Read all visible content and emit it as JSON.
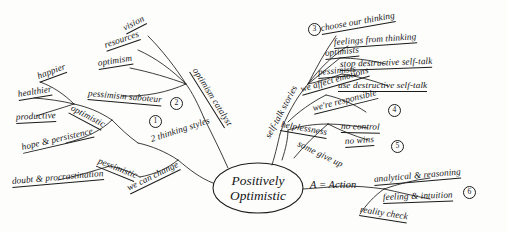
{
  "diagram": {
    "type": "mind-map",
    "title": "Positively Optimistic",
    "center": {
      "line1": "Positively",
      "line2": "Optimistic"
    },
    "branches": [
      {
        "id": "branch-1",
        "number": "1",
        "trunk": "optimistic",
        "leaves": [
          "happier",
          "healthier",
          "productive",
          "hope & persistence"
        ]
      },
      {
        "id": "branch-1b",
        "trunk": "pessimistic",
        "leaves": [
          "doubt & procrastination"
        ]
      },
      {
        "id": "branch-thinking-styles",
        "trunk": "2 thinking styles",
        "leaves": [
          "we can change"
        ]
      },
      {
        "id": "branch-2",
        "number": "2",
        "trunk": "optimism catalyst",
        "leaves": [
          "vision",
          "resources",
          "optimism",
          "pessimism saboteur"
        ]
      },
      {
        "id": "branch-3",
        "number": "3",
        "trunk": "self-talk stories",
        "leaves": [
          "choose our thinking",
          "feelings from thinking"
        ]
      },
      {
        "id": "branch-3b",
        "trunk": "optimists",
        "leaves": [
          "stop destructive self-talk"
        ]
      },
      {
        "id": "branch-3c",
        "trunk": "pessimists",
        "leaves": [
          "use destructive self-talk"
        ]
      },
      {
        "id": "branch-4",
        "number": "4",
        "trunk": "we affect emotions",
        "leaves": [
          "we're responsible"
        ]
      },
      {
        "id": "branch-5",
        "number": "5",
        "trunk": "helplessness",
        "leaves": [
          "no control",
          "no wins",
          "some give up"
        ]
      },
      {
        "id": "branch-6",
        "number": "6",
        "trunk": "A = Action",
        "leaves": [
          "analytical & reasoning",
          "feeling & intuition",
          "reality check"
        ]
      }
    ],
    "labels": {
      "vision": "vision",
      "resources": "resources",
      "optimism": "optimism",
      "pessimism_saboteur": "pessimism saboteur",
      "optimism_catalyst": "optimism catalyst",
      "happier": "happier",
      "healthier": "healthier",
      "productive": "productive",
      "optimistic": "optimistic",
      "hope_persistence": "hope & persistence",
      "pessimistic": "pessimistic",
      "doubt_procrastination": "doubt & procrastination",
      "we_can_change": "we can change",
      "two_thinking_styles": "2 thinking styles",
      "self_talk_stories": "self-talk stories",
      "choose_our_thinking": "choose our thinking",
      "feelings_from_thinking": "feelings from thinking",
      "optimists": "optimists",
      "stop_destructive_self_talk": "stop destructive self-talk",
      "pessimists": "pessimists",
      "use_destructive_self_talk": "use destructive self-talk",
      "we_affect_emotions": "we affect emotions",
      "were_responsible": "we're responsible",
      "helplessness": "helplessness",
      "no_control": "no control",
      "no_wins": "no wins",
      "some_give_up": "some give up",
      "a_equals_action": "A = Action",
      "analytical_reasoning": "analytical & reasoning",
      "feeling_intuition": "feeling & intuition",
      "reality_check": "reality check"
    },
    "numbers": {
      "n1": "1",
      "n2": "2",
      "n3": "3",
      "n4": "4",
      "n5": "5",
      "n6": "6"
    },
    "colors": {
      "ink": "#1b1b1b",
      "paper": "#fdfdfc"
    }
  }
}
